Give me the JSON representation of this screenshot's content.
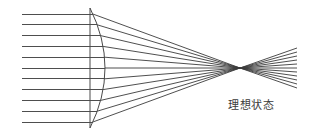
{
  "figure": {
    "caption": "理想状态",
    "caption_meaning": "ideal state",
    "background_color": "#ffffff",
    "ray_color": "#3b3b3b",
    "lens_color": "#4a4a4a"
  },
  "chart_data": {
    "type": "diagram",
    "title": "理想状态",
    "canvas": {
      "width": 309,
      "height": 135
    },
    "elements": {
      "incoming_rays": {
        "label": "parallel incident rays",
        "count": 11,
        "start_x": 22,
        "end_x": 92,
        "y_values": [
          14,
          24.8,
          35.6,
          46.4,
          57.2,
          68,
          78.8,
          89.6,
          100.4,
          111.2,
          122
        ],
        "orientation": "horizontal"
      },
      "lens": {
        "label": "plano-convex lens",
        "flat_edge_x": 90,
        "apex_x": 105,
        "top_y": 8,
        "bottom_y": 128,
        "shape": "flat left face, convex right face"
      },
      "focal_point": {
        "x": 240,
        "y": 68,
        "label": "focal point"
      },
      "converging_rays": {
        "label": "refracted converging rays",
        "count": 11,
        "from": "lens curved surface",
        "to": "focal point"
      },
      "diverging_rays": {
        "label": "rays diverging past focus",
        "count": 11,
        "end_x": 297,
        "end_y_min": 48,
        "end_y_max": 88
      }
    },
    "xlabel": "",
    "ylabel": "",
    "grid": false,
    "legend": "none"
  }
}
